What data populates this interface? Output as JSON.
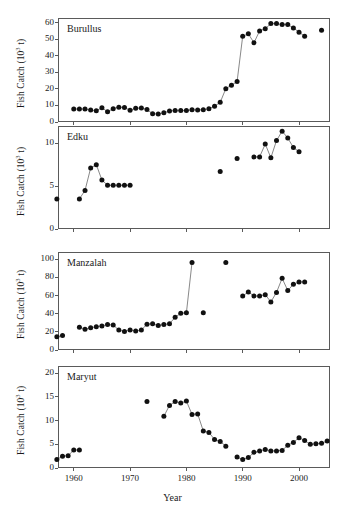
{
  "figure": {
    "y_axis_label": "Fish Catch (10",
    "y_axis_label_sup": "3",
    "y_axis_label_tail": " t)",
    "x_axis_label": "Year",
    "marker_color": "#111111",
    "line_color": "#555555",
    "frame_color": "#5a5a5a"
  },
  "chart_data": [
    {
      "type": "scatter",
      "title": "Burullus",
      "xlabel": "Year",
      "ylabel": "Fish Catch (10^3 t)",
      "xlim": [
        1957.2,
        1005.5
      ],
      "x_range": [
        1957.2,
        2005.5
      ],
      "ylim": [
        0,
        63
      ],
      "yticks": [
        0,
        10,
        20,
        30,
        40,
        50,
        60
      ],
      "xticks": [
        1960,
        1970,
        1980,
        1990,
        2000
      ],
      "grid": false,
      "legend": "none",
      "x": [
        1960,
        1961,
        1962,
        1963,
        1964,
        1965,
        1966,
        1967,
        1968,
        1969,
        1970,
        1971,
        1972,
        1973,
        1974,
        1975,
        1976,
        1977,
        1978,
        1979,
        1980,
        1981,
        1982,
        1983,
        1984,
        1985,
        1986,
        1987,
        1988,
        1989,
        1990,
        1991,
        1992,
        1993,
        1994,
        1995,
        1996,
        1997,
        1998,
        1999,
        2000,
        2001,
        2004
      ],
      "y": [
        7.8,
        7.9,
        7.8,
        7.2,
        6.8,
        8.7,
        6.2,
        8.1,
        9.0,
        8.8,
        7.1,
        8.3,
        8.5,
        7.6,
        5.0,
        4.8,
        5.6,
        6.7,
        6.9,
        6.9,
        6.9,
        7.4,
        7.3,
        7.4,
        8.0,
        9.6,
        11.9,
        20.2,
        22.3,
        24.5,
        52.0,
        53.4,
        48.0,
        55.2,
        56.5,
        59.6,
        59.6,
        59.0,
        59.0,
        57.0,
        54.4,
        52.0,
        55.6
      ]
    },
    {
      "type": "scatter",
      "title": "Edku",
      "xlabel": "Year",
      "ylabel": "Fish Catch (10^3 t)",
      "x_range": [
        1957.2,
        2005.5
      ],
      "ylim": [
        0,
        12
      ],
      "yticks": [
        0,
        5,
        10
      ],
      "xticks": [
        1960,
        1970,
        1980,
        1990,
        2000
      ],
      "grid": false,
      "legend": "none",
      "x": [
        1957,
        1961,
        1962,
        1963,
        1964,
        1965,
        1966,
        1967,
        1968,
        1969,
        1970,
        1986,
        1989,
        1992,
        1993,
        1994,
        1995,
        1996,
        1997,
        1998,
        1999,
        2000
      ],
      "y": [
        3.5,
        3.5,
        4.5,
        7.1,
        7.5,
        5.7,
        5.1,
        5.1,
        5.1,
        5.1,
        5.1,
        6.7,
        8.2,
        8.4,
        8.4,
        9.9,
        8.3,
        10.3,
        11.4,
        10.6,
        9.5,
        9.0
      ]
    },
    {
      "type": "scatter",
      "title": "Manzalah",
      "xlabel": "Year",
      "ylabel": "Fish Catch (10^3 t)",
      "x_range": [
        1957.2,
        2005.5
      ],
      "ylim": [
        0,
        108
      ],
      "yticks": [
        0,
        20,
        40,
        60,
        80,
        100
      ],
      "xticks": [
        1960,
        1970,
        1980,
        1990,
        2000
      ],
      "grid": false,
      "legend": "none",
      "x": [
        1957,
        1958,
        1961,
        1962,
        1963,
        1964,
        1965,
        1966,
        1967,
        1968,
        1969,
        1970,
        1971,
        1972,
        1973,
        1974,
        1975,
        1976,
        1977,
        1978,
        1979,
        1980,
        1981,
        1983,
        1987,
        1990,
        1991,
        1992,
        1993,
        1994,
        1995,
        1996,
        1997,
        1998,
        1999,
        2000,
        2001
      ],
      "y": [
        14.5,
        16.0,
        25.0,
        23.0,
        24.5,
        25.5,
        26.5,
        28.0,
        27.5,
        22.0,
        20.5,
        22.0,
        21.0,
        22.0,
        28.5,
        29.0,
        27.0,
        28.0,
        29.0,
        36.0,
        40.5,
        41.0,
        96.5,
        41.0,
        96.5,
        59.5,
        64.0,
        59.5,
        59.5,
        61.0,
        53.0,
        63.5,
        79.0,
        65.5,
        72.5,
        75.0,
        75.0
      ]
    },
    {
      "type": "scatter",
      "title": "Maryut",
      "xlabel": "Year",
      "ylabel": "Fish Catch (10^3 t)",
      "x_range": [
        1957.2,
        2005.5
      ],
      "ylim": [
        0,
        21.5
      ],
      "yticks": [
        0,
        5,
        10,
        15,
        20
      ],
      "xticks": [
        1960,
        1970,
        1980,
        1990,
        2000
      ],
      "grid": false,
      "legend": "none",
      "x": [
        1957,
        1958,
        1959,
        1960,
        1961,
        1973,
        1976,
        1977,
        1978,
        1979,
        1980,
        1981,
        1982,
        1983,
        1984,
        1985,
        1986,
        1987,
        1989,
        1990,
        1991,
        1992,
        1993,
        1994,
        1995,
        1996,
        1997,
        1998,
        1999,
        2000,
        2001,
        2002,
        2003,
        2004,
        2005
      ],
      "y": [
        1.8,
        2.5,
        2.6,
        3.8,
        3.8,
        14.0,
        10.9,
        13.2,
        14.0,
        13.7,
        14.1,
        11.3,
        11.4,
        7.8,
        7.5,
        6.0,
        5.6,
        4.6,
        2.3,
        1.8,
        2.2,
        3.3,
        3.6,
        3.9,
        3.6,
        3.6,
        3.7,
        4.8,
        5.4,
        6.4,
        5.8,
        5.0,
        5.1,
        5.2,
        5.7
      ]
    }
  ],
  "panels": [
    {
      "title": "Burullus"
    },
    {
      "title": "Edku"
    },
    {
      "title": "Manzalah"
    },
    {
      "title": "Maryut"
    }
  ],
  "xticklabels": [
    "1960",
    "1970",
    "1980",
    "1990",
    "2000"
  ]
}
